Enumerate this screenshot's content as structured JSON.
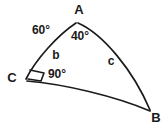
{
  "figure": {
    "background_color": "#ffffff",
    "stroke_color": "#1a1a1a",
    "vertices": [
      {
        "id": "A",
        "label": "A",
        "x": 77,
        "y": 22,
        "label_x": 79,
        "label_y": 11
      },
      {
        "id": "B",
        "label": "B",
        "x": 150,
        "y": 110,
        "label_x": 156,
        "label_y": 119
      },
      {
        "id": "C",
        "label": "C",
        "x": 25,
        "y": 79,
        "label_x": 12,
        "label_y": 79
      }
    ],
    "angles": [
      {
        "at": "C-exterior",
        "label": "60°",
        "label_x": 41,
        "label_y": 31
      },
      {
        "at": "A",
        "label": "40°",
        "label_x": 80,
        "label_y": 37
      },
      {
        "at": "C",
        "label": "90°",
        "label_x": 57,
        "label_y": 75
      }
    ],
    "sides": [
      {
        "id": "b",
        "label": "b",
        "from": "C",
        "to": "A",
        "label_x": 56,
        "label_y": 56
      },
      {
        "id": "c",
        "label": "c",
        "from": "A",
        "to": "B",
        "label_x": 111,
        "label_y": 62
      },
      {
        "id": "a",
        "label": "",
        "from": "C",
        "to": "B",
        "label_x": 0,
        "label_y": 0
      }
    ],
    "right_angle_marker": {
      "at": "C",
      "type": "right-angle-parallelogram"
    }
  }
}
